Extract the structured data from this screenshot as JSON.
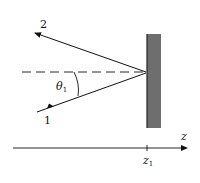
{
  "diagram": {
    "labels": {
      "ray_out": "2",
      "ray_in": "1",
      "angle": "θ",
      "angle_sub": "1",
      "axis": "z",
      "position": "z",
      "position_sub": "1"
    },
    "colors": {
      "line": "#111111",
      "wall_fill": "#6e6e6e",
      "wall_edge": "#222222"
    }
  }
}
